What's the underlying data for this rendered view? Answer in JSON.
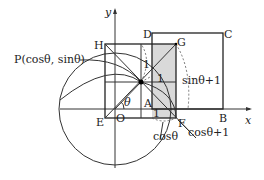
{
  "diagram": {
    "axes": {
      "x_label": "x",
      "y_label": "y",
      "origin_label": "O"
    },
    "points": {
      "P": "P(cosθ, sinθ)",
      "A": "A",
      "B": "B",
      "C": "C",
      "D": "D",
      "E": "E",
      "F": "F",
      "G": "G",
      "H": "H"
    },
    "annotations": {
      "theta": "θ",
      "one_vertical": "1",
      "one_horizontal": "1",
      "one_bottom": "1",
      "sin_theta_plus_1": "sinθ+1",
      "cos_theta": "cosθ",
      "cos_theta_plus_1": "cosθ+1"
    },
    "colors": {
      "shade": "#d9d9d9",
      "line": "#333333"
    }
  }
}
